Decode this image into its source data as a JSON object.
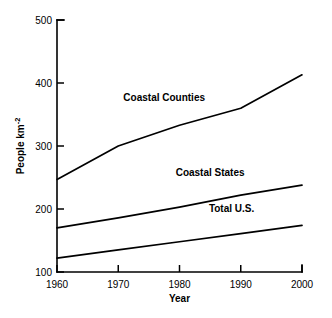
{
  "chart_data": {
    "type": "line",
    "title": "",
    "subtitle": "",
    "xlabel": "Year",
    "ylabel": "People km-2",
    "ylabel_base": "People km",
    "ylabel_exponent": "-2",
    "x": [
      1960,
      1970,
      1980,
      1990,
      2000
    ],
    "xlim": [
      1960,
      2000
    ],
    "ylim": [
      100,
      500
    ],
    "xticks": [
      1960,
      1970,
      1980,
      1990,
      2000
    ],
    "yticks": [
      100,
      200,
      300,
      400,
      500
    ],
    "xtick_labels": [
      "1960",
      "1970",
      "1980",
      "1990",
      "2000"
    ],
    "ytick_labels": [
      "100",
      "200",
      "300",
      "400",
      "500"
    ],
    "grid": false,
    "legend": "inline-labels",
    "legend_position": "inline",
    "line_color": "#000000",
    "background_color": "#ffffff",
    "series": [
      {
        "name": "Coastal Counties",
        "values": [
          247,
          300,
          333,
          360,
          413
        ],
        "label_x": 1977.5,
        "label_y": 372
      },
      {
        "name": "Coastal States",
        "values": [
          170,
          186,
          203,
          222,
          238
        ],
        "label_x": 1985,
        "label_y": 252
      },
      {
        "name": "Total U.S.",
        "values": [
          122,
          135,
          148,
          161,
          174
        ],
        "label_x": 1988.5,
        "label_y": 195
      }
    ]
  }
}
